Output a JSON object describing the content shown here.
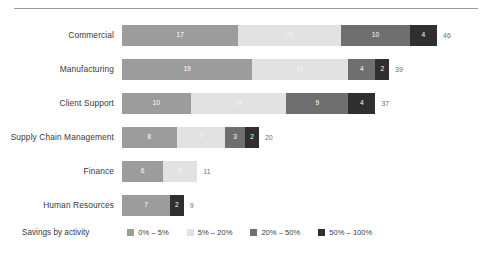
{
  "chart_data": {
    "type": "bar",
    "orientation": "horizontal",
    "stacked": true,
    "title": "",
    "xlabel": "",
    "ylabel": "",
    "grid": false,
    "legend_position": "bottom",
    "legend_title": "Savings by activity",
    "xlim": [
      0,
      46
    ],
    "categories": [
      "Commercial",
      "Manufacturing",
      "Client Support",
      "Supply Chain Management",
      "Finance",
      "Human Resources"
    ],
    "series": [
      {
        "name": "0% – 5%",
        "color": "#9c9c9c",
        "values": [
          17,
          19,
          10,
          8,
          6,
          7
        ]
      },
      {
        "name": "5% – 20%",
        "color": "#e2e2e2",
        "values": [
          15,
          14,
          14,
          7,
          5,
          0
        ]
      },
      {
        "name": "20% – 50%",
        "color": "#6f6f6f",
        "values": [
          10,
          4,
          9,
          3,
          0,
          0
        ]
      },
      {
        "name": "50% – 100%",
        "color": "#2f2f2f",
        "values": [
          4,
          2,
          4,
          2,
          0,
          2
        ]
      }
    ],
    "totals": [
      46,
      39,
      37,
      20,
      11,
      9
    ]
  },
  "legend": {
    "title": "Savings by activity",
    "items": [
      {
        "label": "0% – 5%",
        "color": "#9c9c9c"
      },
      {
        "label": "5% – 20%",
        "color": "#e2e2e2"
      },
      {
        "label": "20% – 50%",
        "color": "#6f6f6f"
      },
      {
        "label": "50% – 100%",
        "color": "#2f2f2f"
      }
    ]
  },
  "layout": {
    "bar_origin_px": 130,
    "px_per_unit": 6.85,
    "row_height_px": 34,
    "first_row_top_px": 6
  }
}
